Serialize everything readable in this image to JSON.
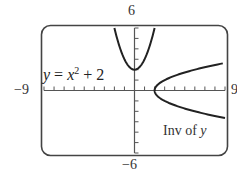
{
  "chart_data": {
    "type": "line",
    "title": "",
    "xlabel": "",
    "ylabel": "",
    "xlim": [
      -9,
      9
    ],
    "ylim": [
      -6,
      6
    ],
    "grid": false,
    "axis_labels": {
      "xmin": "−9",
      "xmax": "9",
      "ymax": "6",
      "ymin": "−6"
    },
    "x_tick_step": 1,
    "y_tick_step": 1,
    "series": [
      {
        "name": "y = x^2 + 2",
        "label": "y = x² + 2",
        "function": "x^2 + 2",
        "x": [
          -2,
          -1.5,
          -1,
          -0.5,
          0,
          0.5,
          1,
          1.5,
          2
        ],
        "values": [
          6,
          4.25,
          3,
          2.25,
          2,
          2.25,
          3,
          4.25,
          6
        ]
      },
      {
        "name": "Inv of y",
        "label": "Inv of y",
        "function": "x = y^2 + 2",
        "x": [
          6,
          4.25,
          3,
          2.25,
          2,
          2.25,
          3,
          4.25,
          6,
          9
        ],
        "values": [
          2,
          1.5,
          1,
          0.5,
          0,
          -0.5,
          -1,
          -1.5,
          -2,
          -2.65
        ]
      }
    ],
    "annotations": [
      {
        "text": "y = x² + 2",
        "position": "upper-left near origin"
      },
      {
        "text": "Inv of y",
        "position": "lower-right"
      }
    ]
  },
  "labels": {
    "xmin": "−9",
    "xmax": "9",
    "ymax": "6",
    "ymin": "−6",
    "eq_y": "y",
    "eq_eq": " = ",
    "eq_x": "x",
    "eq_exp": "2",
    "eq_plus": " + 2",
    "inv_text": "Inv of ",
    "inv_y": "y"
  }
}
